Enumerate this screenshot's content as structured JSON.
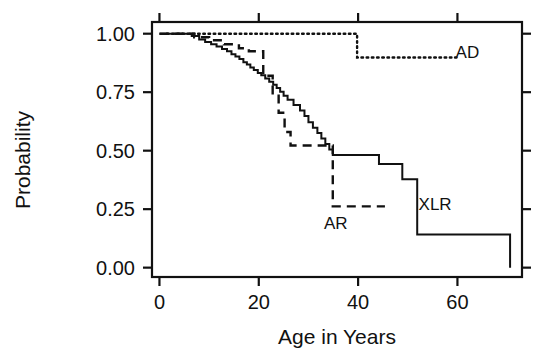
{
  "chart_data": {
    "type": "line",
    "subtype": "kaplan-meier-survival-step",
    "title": "",
    "xlabel": "Age in Years",
    "ylabel": "Probability",
    "xlim": [
      -1.5,
      73
    ],
    "ylim": [
      -0.04,
      1.05
    ],
    "grid": false,
    "legend_position": "inline-annotations",
    "xticks": [
      0,
      20,
      40,
      60
    ],
    "xtick_labels": [
      "0",
      "20",
      "40",
      "60"
    ],
    "yticks": [
      0.0,
      0.25,
      0.5,
      0.75,
      1.0
    ],
    "ytick_labels": [
      "0.00",
      "0.25",
      "0.50",
      "0.75",
      "1.00"
    ],
    "series": [
      {
        "name": "XLR",
        "label": "XLR",
        "line_style": "solid",
        "color": "#111111",
        "label_x": 55.5,
        "label_y": 0.245,
        "points": [
          [
            0,
            1.0
          ],
          [
            6.5,
            1.0
          ],
          [
            6.5,
            0.99
          ],
          [
            8.0,
            0.99
          ],
          [
            8.0,
            0.975
          ],
          [
            9.2,
            0.975
          ],
          [
            9.2,
            0.965
          ],
          [
            10.4,
            0.965
          ],
          [
            10.4,
            0.955
          ],
          [
            11.5,
            0.955
          ],
          [
            11.5,
            0.945
          ],
          [
            12.6,
            0.945
          ],
          [
            12.6,
            0.935
          ],
          [
            13.6,
            0.935
          ],
          [
            13.6,
            0.925
          ],
          [
            14.5,
            0.925
          ],
          [
            14.5,
            0.912
          ],
          [
            15.3,
            0.912
          ],
          [
            15.3,
            0.902
          ],
          [
            16.1,
            0.902
          ],
          [
            16.1,
            0.892
          ],
          [
            16.9,
            0.892
          ],
          [
            16.9,
            0.878
          ],
          [
            17.6,
            0.878
          ],
          [
            17.6,
            0.868
          ],
          [
            18.3,
            0.868
          ],
          [
            18.3,
            0.855
          ],
          [
            19.0,
            0.855
          ],
          [
            19.0,
            0.845
          ],
          [
            19.8,
            0.845
          ],
          [
            19.8,
            0.832
          ],
          [
            20.5,
            0.832
          ],
          [
            20.5,
            0.822
          ],
          [
            21.3,
            0.822
          ],
          [
            21.3,
            0.808
          ],
          [
            22.1,
            0.808
          ],
          [
            22.1,
            0.795
          ],
          [
            22.9,
            0.795
          ],
          [
            22.9,
            0.782
          ],
          [
            23.6,
            0.782
          ],
          [
            23.6,
            0.768
          ],
          [
            24.3,
            0.768
          ],
          [
            24.3,
            0.752
          ],
          [
            25.0,
            0.752
          ],
          [
            25.0,
            0.735
          ],
          [
            25.8,
            0.735
          ],
          [
            25.8,
            0.718
          ],
          [
            27.0,
            0.718
          ],
          [
            27.0,
            0.695
          ],
          [
            28.3,
            0.695
          ],
          [
            28.3,
            0.672
          ],
          [
            29.2,
            0.672
          ],
          [
            29.2,
            0.648
          ],
          [
            30.0,
            0.648
          ],
          [
            30.0,
            0.622
          ],
          [
            30.9,
            0.622
          ],
          [
            30.9,
            0.598
          ],
          [
            31.8,
            0.598
          ],
          [
            31.8,
            0.575
          ],
          [
            32.6,
            0.575
          ],
          [
            32.6,
            0.552
          ],
          [
            33.4,
            0.552
          ],
          [
            33.4,
            0.528
          ],
          [
            34.2,
            0.528
          ],
          [
            34.2,
            0.505
          ],
          [
            34.9,
            0.505
          ],
          [
            34.9,
            0.482
          ],
          [
            44.2,
            0.482
          ],
          [
            44.2,
            0.443
          ],
          [
            48.9,
            0.443
          ],
          [
            48.9,
            0.378
          ],
          [
            51.9,
            0.378
          ],
          [
            51.9,
            0.142
          ],
          [
            70.6,
            0.142
          ],
          [
            70.6,
            0.0
          ]
        ]
      },
      {
        "name": "AR",
        "label": "AR",
        "line_style": "dashed",
        "color": "#111111",
        "label_x": 35.5,
        "label_y": 0.165,
        "points": [
          [
            0,
            1.0
          ],
          [
            7.0,
            1.0
          ],
          [
            7.0,
            0.985
          ],
          [
            10.0,
            0.985
          ],
          [
            10.0,
            0.972
          ],
          [
            13.0,
            0.972
          ],
          [
            13.0,
            0.955
          ],
          [
            16.0,
            0.955
          ],
          [
            16.0,
            0.938
          ],
          [
            18.0,
            0.938
          ],
          [
            18.0,
            0.925
          ],
          [
            20.9,
            0.925
          ],
          [
            20.9,
            0.82
          ],
          [
            22.8,
            0.82
          ],
          [
            22.8,
            0.735
          ],
          [
            24.0,
            0.735
          ],
          [
            24.0,
            0.662
          ],
          [
            25.2,
            0.662
          ],
          [
            25.2,
            0.58
          ],
          [
            26.4,
            0.58
          ],
          [
            26.4,
            0.522
          ],
          [
            34.9,
            0.522
          ],
          [
            34.9,
            0.262
          ],
          [
            45.4,
            0.262
          ]
        ]
      },
      {
        "name": "AD",
        "label": "AD",
        "line_style": "dotted",
        "color": "#111111",
        "label_x": 62.0,
        "label_y": 0.895,
        "points": [
          [
            1.5,
            1.0
          ],
          [
            39.8,
            1.0
          ],
          [
            39.8,
            0.898
          ],
          [
            59.8,
            0.898
          ]
        ]
      }
    ]
  },
  "axes": {
    "y_axis_title": "Probability",
    "x_axis_title": "Age in Years"
  }
}
